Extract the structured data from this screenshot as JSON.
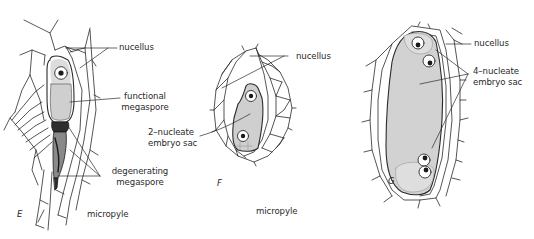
{
  "figure": {
    "panels": [
      {
        "id": "E",
        "letter": "E",
        "labels": {
          "nucellus": "nucellus",
          "functional_line1": "functional",
          "functional_line2": "megaspore",
          "degenerating_line1": "degenerating",
          "degenerating_line2": "megaspore",
          "micropyle": "micropyle"
        }
      },
      {
        "id": "F",
        "letter": "F",
        "labels": {
          "nucellus": "nucellus",
          "sac_line1": "2–nucleate",
          "sac_line2": "embryo sac",
          "micropyle": "micropyle"
        }
      },
      {
        "id": "G",
        "letter": "G",
        "labels": {
          "nucellus": "nucellus",
          "sac_line1": "4–nucleate",
          "sac_line2": "embryo sac"
        }
      }
    ],
    "colors": {
      "line": "#2a2a2a",
      "cytoplasm": "#d4d4d4",
      "cell_fill": "#ffffff",
      "nucleus": "#1a1a1a",
      "degenerating": "#3a3a3a",
      "background": "#ffffff"
    }
  }
}
